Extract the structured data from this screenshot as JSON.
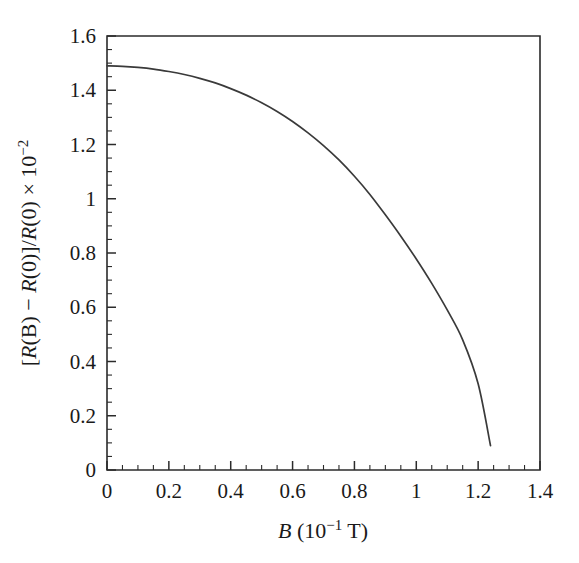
{
  "figure": {
    "background_color": "#ffffff",
    "curve_color": "#3a3a3a",
    "axis_color": "#2b2b2b"
  },
  "chart_data": {
    "type": "line",
    "title": "",
    "subtitle": "",
    "xlabel": "B (10⁻¹ T)",
    "xlabel_parts": {
      "symbol": "B",
      "unit_open": " (10",
      "unit_exp": "−1",
      "unit_close": " T)"
    },
    "ylabel": "[R(B) − R(0)]/R(0) × 10⁻²",
    "ylabel_parts": {
      "bracket_open": "[",
      "r_b": "R",
      "paren_b": "(B)",
      "minus": " − ",
      "r_0a": "R",
      "paren_0a": "(0)]/",
      "r_0b": "R",
      "paren_0b": "(0)",
      "times": " × 10",
      "exp": "−2"
    },
    "xlim": [
      0,
      1.4
    ],
    "ylim": [
      0,
      1.6
    ],
    "x_major_ticks": [
      0,
      0.2,
      0.4,
      0.6,
      0.8,
      1,
      1.2,
      1.4
    ],
    "x_major_tick_labels": [
      "0",
      "0.2",
      "0.4",
      "0.6",
      "0.8",
      "1",
      "1.2",
      "1.4"
    ],
    "x_minor_tick_step": 0.05,
    "y_major_ticks": [
      0,
      0.2,
      0.4,
      0.6,
      0.8,
      1,
      1.2,
      1.4,
      1.6
    ],
    "y_major_tick_labels": [
      "0",
      "0.2",
      "0.4",
      "0.6",
      "0.8",
      "1",
      "1.2",
      "1.4",
      "1.6"
    ],
    "y_minor_tick_step": 0.05,
    "grid": false,
    "legend": null,
    "tick_direction": "in",
    "series": [
      {
        "name": "magnetoresistance",
        "x": [
          0.0,
          0.05,
          0.1,
          0.15,
          0.2,
          0.25,
          0.3,
          0.35,
          0.4,
          0.45,
          0.5,
          0.55,
          0.6,
          0.65,
          0.7,
          0.75,
          0.8,
          0.85,
          0.9,
          0.95,
          1.0,
          1.05,
          1.1,
          1.15,
          1.2,
          1.24
        ],
        "y": [
          1.49,
          1.488,
          1.484,
          1.478,
          1.469,
          1.458,
          1.444,
          1.427,
          1.406,
          1.382,
          1.354,
          1.322,
          1.285,
          1.243,
          1.196,
          1.143,
          1.083,
          1.016,
          0.941,
          0.862,
          0.778,
          0.688,
          0.59,
          0.48,
          0.318,
          0.09
        ]
      }
    ]
  }
}
